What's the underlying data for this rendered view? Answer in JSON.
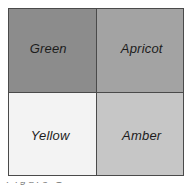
{
  "figure": {
    "name": "colour-matrix",
    "background": "#ffffff",
    "border_color": "#4a4a4a",
    "divider_color": "#4a4a4a"
  },
  "matrix": {
    "rows": 2,
    "columns": 2,
    "cells": [
      {
        "position": "top-left",
        "label": "Green",
        "fill": "#8c8c8c",
        "text_color": "#1c1c1c"
      },
      {
        "position": "top-right",
        "label": "Apricot",
        "fill": "#a3a3a3",
        "text_color": "#1c1c1c"
      },
      {
        "position": "bottom-left",
        "label": "Yellow",
        "fill": "#f3f3f3",
        "text_color": "#1c1c1c"
      },
      {
        "position": "bottom-right",
        "label": "Amber",
        "fill": "#c6c6c6",
        "text_color": "#1c1c1c"
      }
    ]
  },
  "caption": {
    "clipped_text": "Figure 1"
  }
}
